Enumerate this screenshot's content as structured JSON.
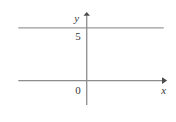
{
  "chart_data": {
    "type": "line",
    "title": "",
    "subtitle": "",
    "xlabel": "x",
    "ylabel": "y",
    "grid": false,
    "legend": null,
    "axis_origin_label": "0",
    "y_tick_labels": [
      "5"
    ],
    "y_ticks": [
      5
    ],
    "x_tick_labels": [],
    "x_ticks": [],
    "xlim": [
      -8.5,
      9.5
    ],
    "ylim": [
      -2.5,
      6.5
    ],
    "series": [
      {
        "name": "y = 5",
        "kind": "horizontal-line",
        "y_value": 5,
        "x": [
          -8.0,
          9.0
        ],
        "values": [
          5,
          5
        ],
        "color": "#9a9a9a"
      }
    ],
    "annotations": [],
    "axes": {
      "x_axis": {
        "label": "x",
        "arrow": "right",
        "color": "#8c8c8c"
      },
      "y_axis": {
        "label": "y",
        "arrow": "up",
        "color": "#8c8c8c"
      }
    }
  },
  "figure": {
    "labels": {
      "y_axis_name": "y",
      "x_axis_name": "x",
      "origin": "0",
      "y_tick_five": "5"
    },
    "colors": {
      "background": "#ffffff",
      "axis": "#8c8c8c",
      "line": "#9a9a9a",
      "text": "#3a3a3a"
    }
  }
}
